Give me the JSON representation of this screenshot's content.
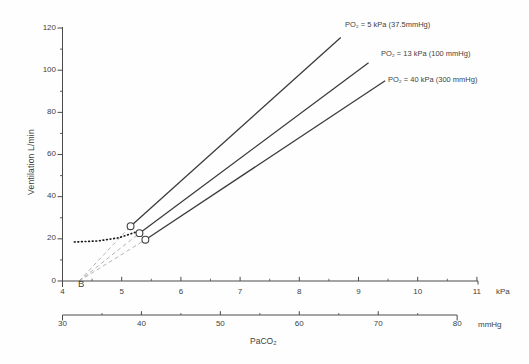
{
  "figure_colors": {
    "background": "#fefefe",
    "axis": "#4a4a4a",
    "text": "#3f3f3f",
    "solid_line": "#3b3b3b",
    "dashed_line": "#b3b3b3",
    "dotted_line": "#1a1a1a",
    "marker_fill": "#ffffff",
    "marker_stroke": "#3f3f3f"
  },
  "chart_data": {
    "type": "line",
    "title": "",
    "xlabel": "PaCO₂",
    "ylabel": "Ventilation L/min",
    "y_axis": {
      "min": 0,
      "max": 120,
      "major_ticks": [
        0,
        20,
        40,
        60,
        80,
        100,
        120
      ],
      "minor_step": 10
    },
    "x_axis_kpa": {
      "unit": "kPa",
      "min": 4,
      "max": 11,
      "major_ticks": [
        4,
        5,
        6,
        7,
        8,
        9,
        10,
        11
      ],
      "minor_step": 0.5
    },
    "x_axis_mmhg": {
      "unit": "mmHg",
      "min": 30,
      "max": 80,
      "major_ticks": [
        30,
        40,
        50,
        60,
        70,
        80
      ],
      "minor_step": 5
    },
    "series": [
      {
        "name": "PO₂ = 5 kPa (37.5mmHg)",
        "style": "solid",
        "line": [
          [
            5.15,
            26.0
          ],
          [
            8.7,
            115.5
          ]
        ],
        "marker": [
          5.15,
          26.0
        ],
        "extrapolation": [
          [
            4.28,
            0
          ],
          [
            5.15,
            26.0
          ]
        ]
      },
      {
        "name": "PO₂ = 13 kPa (100 mmHg)",
        "style": "solid",
        "line": [
          [
            5.3,
            22.7
          ],
          [
            9.17,
            103.5
          ]
        ],
        "marker": [
          5.3,
          22.7
        ],
        "extrapolation": [
          [
            4.28,
            0
          ],
          [
            5.3,
            22.7
          ]
        ]
      },
      {
        "name": "PO₂ = 40 kPa (300 mmHg)",
        "style": "solid",
        "line": [
          [
            5.4,
            19.6
          ],
          [
            9.45,
            95.0
          ]
        ],
        "marker": [
          5.4,
          19.6
        ],
        "extrapolation": [
          [
            4.28,
            0
          ],
          [
            5.4,
            19.6
          ]
        ]
      }
    ],
    "dotted_line": [
      [
        4.2,
        18.5
      ],
      [
        4.6,
        19.0
      ],
      [
        4.95,
        20.5
      ],
      [
        5.26,
        23.4
      ]
    ],
    "annotations": [
      {
        "text": "B",
        "x_kpa": 4.28,
        "y": 0
      }
    ],
    "legend_position": "none",
    "grid": false
  }
}
